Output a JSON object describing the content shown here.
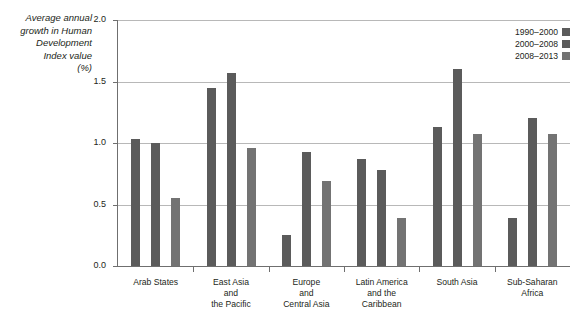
{
  "chart_data": {
    "type": "bar",
    "title": "",
    "subtitle": "",
    "ylabel": "Average annual\ngrowth in Human\nDevelopment\nIndex value\n(%)",
    "xlabel": "",
    "ylim": [
      0.0,
      2.0
    ],
    "yticks": [
      "0.0",
      "0.5",
      "1.0",
      "1.5",
      "2.0"
    ],
    "ytick_values": [
      0.0,
      0.5,
      1.0,
      1.5,
      2.0
    ],
    "grid": "horizontal",
    "legend_position": "top-right",
    "categories": [
      "Arab States",
      "East Asia\nand\nthe Pacific",
      "Europe\nand\nCentral Asia",
      "Latin America\nand the\nCaribbean",
      "South Asia",
      "Sub-Saharan\nAfrica"
    ],
    "series": [
      {
        "name": "1990–2000",
        "color": "#5b5b5b",
        "values": [
          1.03,
          1.45,
          0.25,
          0.87,
          1.13,
          0.39
        ]
      },
      {
        "name": "2000–2008",
        "color": "#5b5b5b",
        "values": [
          1.0,
          1.57,
          0.93,
          0.78,
          1.6,
          1.2
        ]
      },
      {
        "name": "2008–2013",
        "color": "#737373",
        "values": [
          0.55,
          0.96,
          0.69,
          0.39,
          1.07,
          1.07
        ]
      }
    ]
  },
  "colors": {
    "axis": "#6f6f6f",
    "gridline": "#b8b8b8",
    "text": "#231f20",
    "background": "#ffffff"
  }
}
